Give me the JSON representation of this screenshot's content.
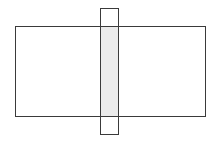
{
  "canvas": {
    "width": 217,
    "height": 144,
    "background": "#ffffff"
  },
  "colors": {
    "stroke": "#3a3a3a",
    "overlap_fill": "#ebebeb"
  },
  "shapes": {
    "horizontal_rect": {
      "x": 15.5,
      "y": 26.5,
      "width": 190,
      "height": 90
    },
    "vertical_rect": {
      "x": 100.5,
      "y": 8.5,
      "width": 18,
      "height": 126
    },
    "overlap_region": {
      "x": 100.5,
      "y": 26.5,
      "width": 18,
      "height": 90
    }
  }
}
